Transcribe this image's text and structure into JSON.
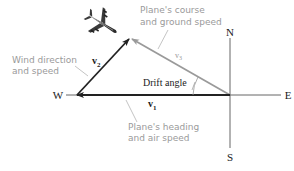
{
  "diagram": {
    "compass": {
      "north": "N",
      "south": "S",
      "east": "E",
      "west": "W"
    },
    "vectors": {
      "v1": {
        "symbol": "v",
        "subscript": "1",
        "color": "#222222"
      },
      "v2": {
        "symbol": "v",
        "subscript": "2",
        "color": "#222222"
      },
      "v3": {
        "symbol": "v",
        "subscript": "3",
        "color": "#9a9a9a"
      }
    },
    "angle_label": "Drift angle",
    "callouts": {
      "course": {
        "line1": "Plane's course",
        "line2": "and ground speed"
      },
      "wind": {
        "line1": "Wind direction",
        "line2": "and speed"
      },
      "heading": {
        "line1": "Plane's heading",
        "line2": "and air speed"
      }
    },
    "icon": "airplane-icon",
    "colors": {
      "axis": "#555555",
      "callout_text": "#9a9a9a",
      "vector_dark": "#222222",
      "vector_light": "#9a9a9a"
    }
  }
}
